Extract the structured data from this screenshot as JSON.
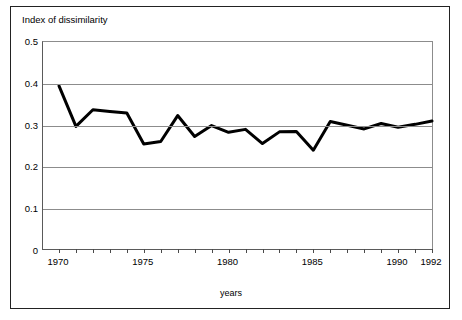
{
  "figure": {
    "y_axis_title": "Index of dissimilarity",
    "x_axis_title": "years"
  },
  "axis": {
    "y_ticks": [
      "0.5",
      "0.4",
      "0.3",
      "0.2",
      "0.1",
      "0"
    ],
    "x_ticks": [
      "1970",
      "1975",
      "1980",
      "1985",
      "1990",
      "1992"
    ]
  },
  "chart_data": {
    "type": "line",
    "title": "",
    "xlabel": "years",
    "ylabel": "Index of dissimilarity",
    "xlim": [
      1970,
      1992
    ],
    "ylim": [
      0,
      0.5
    ],
    "grid": true,
    "legend": "none",
    "x": [
      1970,
      1971,
      1972,
      1973,
      1974,
      1975,
      1976,
      1977,
      1978,
      1979,
      1980,
      1981,
      1982,
      1983,
      1984,
      1985,
      1986,
      1987,
      1988,
      1989,
      1990,
      1991,
      1992
    ],
    "series": [
      {
        "name": "Index of dissimilarity",
        "color": "#000000",
        "values": [
          0.395,
          0.298,
          0.338,
          0.334,
          0.33,
          0.256,
          0.262,
          0.324,
          0.274,
          0.3,
          0.284,
          0.291,
          0.257,
          0.285,
          0.286,
          0.241,
          0.31,
          0.301,
          0.292,
          0.305,
          0.296,
          0.303,
          0.311
        ]
      }
    ],
    "y_tick_values": [
      0.5,
      0.4,
      0.3,
      0.2,
      0.1,
      0
    ],
    "x_tick_values": [
      1970,
      1975,
      1980,
      1985,
      1990,
      1992
    ]
  },
  "style": {
    "line_color": "#000000",
    "grid_color": "#8c8c8c",
    "frame_color": "#222222",
    "background": "#ffffff"
  }
}
